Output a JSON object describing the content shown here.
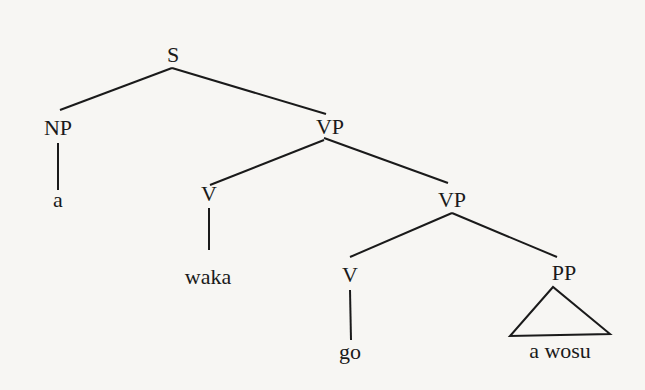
{
  "diagram": {
    "type": "syntax-tree",
    "nodes": {
      "S": "S",
      "NP": "NP",
      "VP1": "VP",
      "NP_leaf": "a",
      "V1": "V",
      "V1_leaf": "waka",
      "VP2": "VP",
      "V2": "V",
      "V2_leaf": "go",
      "PP": "PP",
      "PP_leaf": "a wosu"
    },
    "edges": [
      [
        "S",
        "NP"
      ],
      [
        "S",
        "VP1"
      ],
      [
        "NP",
        "NP_leaf"
      ],
      [
        "VP1",
        "V1"
      ],
      [
        "VP1",
        "VP2"
      ],
      [
        "V1",
        "V1_leaf"
      ],
      [
        "VP2",
        "V2"
      ],
      [
        "VP2",
        "PP"
      ],
      [
        "V2",
        "V2_leaf"
      ],
      [
        "PP",
        "PP_leaf (triangle)"
      ]
    ],
    "colors": {
      "background": "#f7f6f3",
      "ink": "#1a1a1a"
    }
  }
}
